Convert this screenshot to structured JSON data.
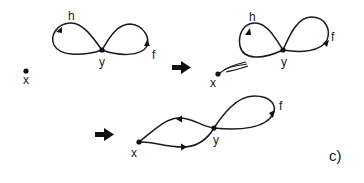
{
  "figure": {
    "panel_label": "c)",
    "panels": [
      {
        "id": "before",
        "nodes": [
          {
            "id": "x",
            "label": "x"
          },
          {
            "id": "y",
            "label": "y"
          }
        ],
        "loops": [
          {
            "id": "h",
            "label": "h"
          },
          {
            "id": "f",
            "label": "f"
          }
        ]
      },
      {
        "id": "during",
        "nodes": [
          {
            "id": "x",
            "label": "x"
          },
          {
            "id": "y",
            "label": "y"
          }
        ],
        "loops": [
          {
            "id": "h",
            "label": "h"
          },
          {
            "id": "f",
            "label": "f"
          }
        ],
        "connector": "double-path-x-to-h"
      },
      {
        "id": "after",
        "nodes": [
          {
            "id": "x",
            "label": "x"
          },
          {
            "id": "y",
            "label": "y"
          }
        ],
        "loops": [
          {
            "id": "f",
            "label": "f"
          }
        ],
        "paths": [
          "upper-x-y",
          "lower-x-y"
        ]
      }
    ],
    "transition_arrows": [
      "arrow-1",
      "arrow-2"
    ],
    "colors": {
      "ink": "#1a1a1a",
      "background": "#ffffff"
    }
  }
}
